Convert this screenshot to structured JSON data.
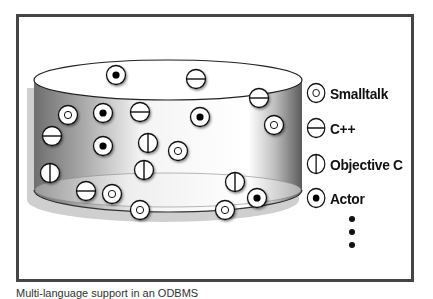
{
  "figure": {
    "caption": "Multi-language support in an ODBMS",
    "frame_border_color": "#454545"
  },
  "legend": {
    "items": [
      {
        "key": "smalltalk",
        "label": "Smalltalk",
        "icon": "circle-with-ring-icon"
      },
      {
        "key": "cpp",
        "label": "C++",
        "icon": "circle-horizontal-bar-icon"
      },
      {
        "key": "objc",
        "label": "Objective C",
        "icon": "circle-vertical-bar-icon"
      },
      {
        "key": "actor",
        "label": "Actor",
        "icon": "circle-with-dot-icon"
      }
    ],
    "more_indicator": "vertical-ellipsis"
  },
  "database": {
    "shape": "cylinder",
    "objects": [
      {
        "type": "actor",
        "x": 116,
        "y": 75
      },
      {
        "type": "cpp",
        "x": 196,
        "y": 79
      },
      {
        "type": "cpp",
        "x": 259,
        "y": 98
      },
      {
        "type": "smalltalk",
        "x": 68,
        "y": 115
      },
      {
        "type": "actor",
        "x": 103,
        "y": 113
      },
      {
        "type": "cpp",
        "x": 140,
        "y": 112
      },
      {
        "type": "actor",
        "x": 200,
        "y": 117
      },
      {
        "type": "smalltalk",
        "x": 274,
        "y": 125
      },
      {
        "type": "cpp",
        "x": 52,
        "y": 136
      },
      {
        "type": "actor",
        "x": 103,
        "y": 146
      },
      {
        "type": "objc",
        "x": 148,
        "y": 143
      },
      {
        "type": "smalltalk",
        "x": 178,
        "y": 151
      },
      {
        "type": "objc",
        "x": 144,
        "y": 170
      },
      {
        "type": "objc",
        "x": 50,
        "y": 173
      },
      {
        "type": "objc",
        "x": 235,
        "y": 182
      },
      {
        "type": "cpp",
        "x": 86,
        "y": 191
      },
      {
        "type": "smalltalk",
        "x": 112,
        "y": 194
      },
      {
        "type": "actor",
        "x": 257,
        "y": 198
      },
      {
        "type": "smalltalk",
        "x": 140,
        "y": 210
      },
      {
        "type": "smalltalk",
        "x": 225,
        "y": 210
      }
    ]
  }
}
